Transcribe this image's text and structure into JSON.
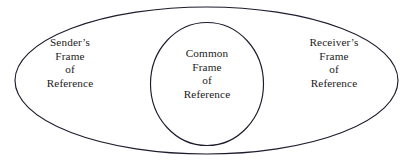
{
  "diagram": {
    "type": "venn-nested-ellipse",
    "background_color": "#ffffff",
    "stroke_color": "#1c1c2e",
    "text_color": "#1a1a1a",
    "outer_region": {
      "name": "outer-ellipse",
      "labels": {
        "left": {
          "line1": "Sender’s",
          "line2": "Frame",
          "line3": "of",
          "line4": "Reference"
        },
        "right": {
          "line1": "Receiver’s",
          "line2": "Frame",
          "line3": "of",
          "line4": "Reference"
        }
      }
    },
    "inner_region": {
      "name": "inner-ellipse",
      "label": {
        "line1": "Common",
        "line2": "Frame",
        "line3": "of",
        "line4": "Reference"
      }
    }
  }
}
